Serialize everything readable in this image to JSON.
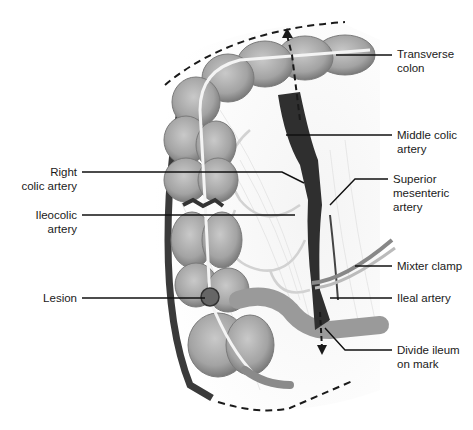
{
  "figure": {
    "colors": {
      "colon": "#a9a9a9",
      "colon_shadow": "#7d7d7d",
      "artery": "#3a3a3a",
      "mesentery": "#ededed",
      "leader": "#111111"
    },
    "labels": {
      "left": [
        {
          "id": "right-colic-artery",
          "text": "Right\ncolic artery"
        },
        {
          "id": "ileocolic-artery",
          "text": "Ileocolic\nartery"
        },
        {
          "id": "lesion",
          "text": "Lesion"
        }
      ],
      "right": [
        {
          "id": "transverse-colon",
          "text": "Transverse\ncolon"
        },
        {
          "id": "middle-colic-artery",
          "text": "Middle colic\nartery"
        },
        {
          "id": "superior-mesenteric-artery",
          "text": "Superior\nmesenteric\nartery"
        },
        {
          "id": "mixter-clamp",
          "text": "Mixter clamp"
        },
        {
          "id": "ileal-artery",
          "text": "Ileal artery"
        },
        {
          "id": "divide-ileum",
          "text": "Divide ileum\non mark"
        }
      ]
    }
  }
}
